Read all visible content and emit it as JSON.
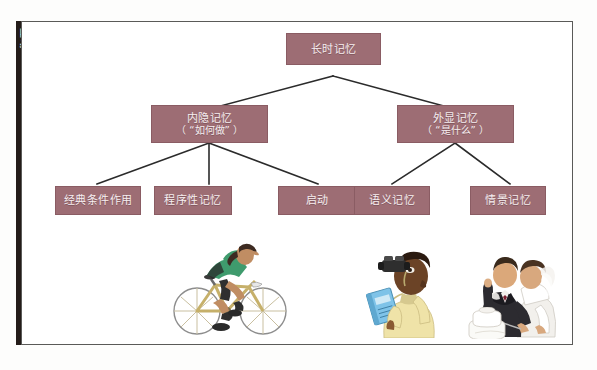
{
  "page": {
    "side_tab_label": "互动",
    "background_color": "#fdfdfc",
    "frame_border_color": "#5a5a58",
    "node_fill_color": "#9d6d74",
    "node_text_color": "#f6eef0",
    "connector_color": "#2b2b2b"
  },
  "diagram": {
    "type": "tree",
    "root": {
      "id": "long-term-memory",
      "label": "长时记忆"
    },
    "level2": [
      {
        "id": "implicit-memory",
        "label": "内隐记忆",
        "sublabel": "（ “如何做” ）"
      },
      {
        "id": "explicit-memory",
        "label": "外显记忆",
        "sublabel": "（ “是什么” ）"
      }
    ],
    "level3": [
      {
        "id": "classical-conditioning",
        "label": "经典条件作用",
        "parent": "implicit-memory"
      },
      {
        "id": "procedural-memory",
        "label": "程序性记忆",
        "parent": "implicit-memory"
      },
      {
        "id": "priming",
        "label": "启动",
        "parent": "implicit-memory"
      },
      {
        "id": "semantic-memory",
        "label": "语义记忆",
        "parent": "explicit-memory"
      },
      {
        "id": "episodic-memory",
        "label": "情景记忆",
        "parent": "explicit-memory"
      }
    ]
  },
  "illustrations": [
    {
      "id": "cyclist",
      "name": "woman-riding-bicycle"
    },
    {
      "id": "photographer",
      "name": "man-with-binoculars-and-book"
    },
    {
      "id": "wedding",
      "name": "bride-and-groom-cutting-cake"
    }
  ]
}
